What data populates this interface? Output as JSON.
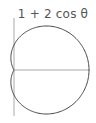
{
  "figure": {
    "title": "1 + 2 cos θ",
    "curve": "polar r = 1 + 2 cos θ",
    "colors": {
      "curve": "#444444",
      "axes": "#aaaaaa",
      "text": "#555555",
      "background": "#ffffff"
    }
  }
}
